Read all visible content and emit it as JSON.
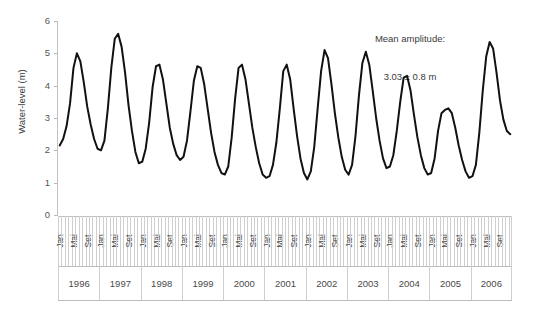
{
  "chart_data": {
    "type": "line",
    "title": "",
    "xlabel": "",
    "ylabel": "Water-level (m)",
    "ylim": [
      0,
      6
    ],
    "yticks": [
      0,
      1,
      2,
      3,
      4,
      5,
      6
    ],
    "grid": false,
    "legend": null,
    "annotation_line1": "Mean amplitude:",
    "annotation_line2": "3.03 ± 0.8 m",
    "month_labels": [
      "Jan",
      "",
      "",
      "",
      "Mai",
      "",
      "",
      "",
      "Set",
      "",
      "",
      ""
    ],
    "month_label_all": [
      "Jan",
      "Mai",
      "Set"
    ],
    "years": [
      "1996",
      "1997",
      "1998",
      "1999",
      "2000",
      "2001",
      "2002",
      "2003",
      "2004",
      "2005",
      "2006"
    ],
    "x_start": "Jan 1996",
    "x_end": "Dez 2006",
    "series": [
      {
        "name": "Water level",
        "color": "#111111",
        "values": [
          2.15,
          2.35,
          2.75,
          3.45,
          4.55,
          5.0,
          4.75,
          4.1,
          3.35,
          2.8,
          2.35,
          2.05,
          2.0,
          2.3,
          3.3,
          4.55,
          5.45,
          5.6,
          5.2,
          4.4,
          3.4,
          2.6,
          1.95,
          1.6,
          1.65,
          2.05,
          2.85,
          3.95,
          4.6,
          4.65,
          4.2,
          3.45,
          2.7,
          2.2,
          1.85,
          1.7,
          1.8,
          2.3,
          3.2,
          4.15,
          4.6,
          4.55,
          4.05,
          3.3,
          2.55,
          1.95,
          1.55,
          1.3,
          1.25,
          1.5,
          2.4,
          3.6,
          4.55,
          4.65,
          4.2,
          3.45,
          2.7,
          2.1,
          1.6,
          1.25,
          1.15,
          1.2,
          1.55,
          2.25,
          3.3,
          4.45,
          4.65,
          4.2,
          3.3,
          2.45,
          1.75,
          1.3,
          1.1,
          1.35,
          2.1,
          3.3,
          4.45,
          5.1,
          4.85,
          4.05,
          3.15,
          2.4,
          1.8,
          1.4,
          1.25,
          1.55,
          2.45,
          3.7,
          4.7,
          5.05,
          4.65,
          3.85,
          3.0,
          2.3,
          1.75,
          1.45,
          1.5,
          1.85,
          2.6,
          3.5,
          4.25,
          4.3,
          3.85,
          3.1,
          2.4,
          1.85,
          1.45,
          1.25,
          1.3,
          1.75,
          2.6,
          3.15,
          3.25,
          3.3,
          3.15,
          2.7,
          2.15,
          1.7,
          1.35,
          1.15,
          1.2,
          1.55,
          2.55,
          3.85,
          4.9,
          5.35,
          5.15,
          4.4,
          3.55,
          2.95,
          2.6,
          2.5
        ]
      }
    ]
  }
}
